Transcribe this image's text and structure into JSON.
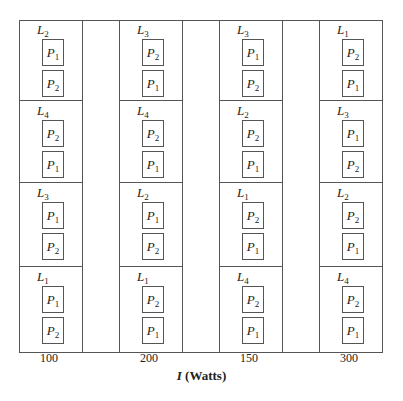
{
  "diagram": {
    "type": "split-plot layout",
    "axis_title": {
      "var": "I",
      "unit": "(Watts)"
    },
    "columns": [
      {
        "tick": "100",
        "blocks": [
          {
            "L": "L",
            "L_sub": "2",
            "top": {
              "P": "P",
              "sub": "1"
            },
            "bottom": {
              "P": "P",
              "sub": "2"
            }
          },
          {
            "L": "L",
            "L_sub": "4",
            "top": {
              "P": "P",
              "sub": "2"
            },
            "bottom": {
              "P": "P",
              "sub": "1"
            }
          },
          {
            "L": "L",
            "L_sub": "3",
            "top": {
              "P": "P",
              "sub": "1"
            },
            "bottom": {
              "P": "P",
              "sub": "2"
            }
          },
          {
            "L": "L",
            "L_sub": "1",
            "top": {
              "P": "P",
              "sub": "1"
            },
            "bottom": {
              "P": "P",
              "sub": "2"
            }
          }
        ]
      },
      {
        "tick": "200",
        "blocks": [
          {
            "L": "L",
            "L_sub": "3",
            "top": {
              "P": "P",
              "sub": "2"
            },
            "bottom": {
              "P": "P",
              "sub": "1"
            }
          },
          {
            "L": "L",
            "L_sub": "4",
            "top": {
              "P": "P",
              "sub": "2"
            },
            "bottom": {
              "P": "P",
              "sub": "1"
            }
          },
          {
            "L": "L",
            "L_sub": "2",
            "top": {
              "P": "P",
              "sub": "1"
            },
            "bottom": {
              "P": "P",
              "sub": "2"
            }
          },
          {
            "L": "L",
            "L_sub": "1",
            "top": {
              "P": "P",
              "sub": "2"
            },
            "bottom": {
              "P": "P",
              "sub": "1"
            }
          }
        ]
      },
      {
        "tick": "150",
        "blocks": [
          {
            "L": "L",
            "L_sub": "3",
            "top": {
              "P": "P",
              "sub": "1"
            },
            "bottom": {
              "P": "P",
              "sub": "2"
            }
          },
          {
            "L": "L",
            "L_sub": "2",
            "top": {
              "P": "P",
              "sub": "2"
            },
            "bottom": {
              "P": "P",
              "sub": "1"
            }
          },
          {
            "L": "L",
            "L_sub": "1",
            "top": {
              "P": "P",
              "sub": "2"
            },
            "bottom": {
              "P": "P",
              "sub": "1"
            }
          },
          {
            "L": "L",
            "L_sub": "4",
            "top": {
              "P": "P",
              "sub": "2"
            },
            "bottom": {
              "P": "P",
              "sub": "1"
            }
          }
        ]
      },
      {
        "tick": "300",
        "blocks": [
          {
            "L": "L",
            "L_sub": "1",
            "top": {
              "P": "P",
              "sub": "2"
            },
            "bottom": {
              "P": "P",
              "sub": "1"
            }
          },
          {
            "L": "L",
            "L_sub": "3",
            "top": {
              "P": "P",
              "sub": "1"
            },
            "bottom": {
              "P": "P",
              "sub": "2"
            }
          },
          {
            "L": "L",
            "L_sub": "2",
            "top": {
              "P": "P",
              "sub": "2"
            },
            "bottom": {
              "P": "P",
              "sub": "1"
            }
          },
          {
            "L": "L",
            "L_sub": "4",
            "top": {
              "P": "P",
              "sub": "2"
            },
            "bottom": {
              "P": "P",
              "sub": "1"
            }
          }
        ]
      }
    ]
  }
}
